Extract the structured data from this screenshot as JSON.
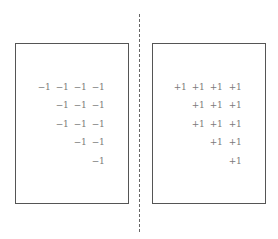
{
  "diagram": {
    "type": "charge-distribution",
    "colors": {
      "border": "#555555",
      "charge": "#7a7a7a",
      "divider": "#666666"
    },
    "left_plate": {
      "label": "negative plate",
      "box": {
        "x": 15,
        "y": 43,
        "w": 114,
        "h": 161
      },
      "charges": [
        {
          "text": "−1",
          "x": 44,
          "y": 87
        },
        {
          "text": "−1",
          "x": 62,
          "y": 87
        },
        {
          "text": "−1",
          "x": 80,
          "y": 87
        },
        {
          "text": "−1",
          "x": 98,
          "y": 87
        },
        {
          "text": "−1",
          "x": 62,
          "y": 105
        },
        {
          "text": "−1",
          "x": 80,
          "y": 105
        },
        {
          "text": "−1",
          "x": 98,
          "y": 105
        },
        {
          "text": "−1",
          "x": 62,
          "y": 124
        },
        {
          "text": "−1",
          "x": 80,
          "y": 124
        },
        {
          "text": "−1",
          "x": 98,
          "y": 124
        },
        {
          "text": "−1",
          "x": 80,
          "y": 142
        },
        {
          "text": "−1",
          "x": 98,
          "y": 142
        },
        {
          "text": "−1",
          "x": 98,
          "y": 161
        }
      ]
    },
    "right_plate": {
      "label": "positive plate",
      "box": {
        "x": 152,
        "y": 43,
        "w": 114,
        "h": 161
      },
      "charges": [
        {
          "text": "+1",
          "x": 180,
          "y": 87
        },
        {
          "text": "+1",
          "x": 198,
          "y": 87
        },
        {
          "text": "+1",
          "x": 216,
          "y": 87
        },
        {
          "text": "+1",
          "x": 235,
          "y": 87
        },
        {
          "text": "+1",
          "x": 198,
          "y": 105
        },
        {
          "text": "+1",
          "x": 216,
          "y": 105
        },
        {
          "text": "+1",
          "x": 235,
          "y": 105
        },
        {
          "text": "+1",
          "x": 198,
          "y": 124
        },
        {
          "text": "+1",
          "x": 216,
          "y": 124
        },
        {
          "text": "+1",
          "x": 235,
          "y": 124
        },
        {
          "text": "+1",
          "x": 216,
          "y": 142
        },
        {
          "text": "+1",
          "x": 235,
          "y": 142
        },
        {
          "text": "+1",
          "x": 235,
          "y": 161
        }
      ]
    },
    "divider": {
      "style": "dashed",
      "x": 139,
      "y_start": 14,
      "y_end": 232
    }
  }
}
